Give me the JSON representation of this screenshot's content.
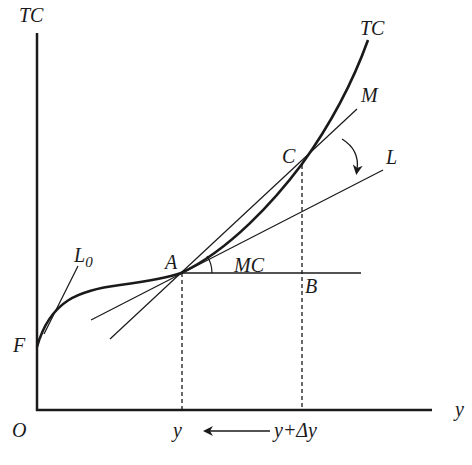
{
  "diagram": {
    "axes": {
      "y_axis_label": "TC",
      "x_axis_label": "y",
      "origin_label": "O"
    },
    "curve": {
      "name": "TC",
      "label": "TC"
    },
    "points": {
      "F": "F",
      "A": "A",
      "B": "B",
      "C": "C"
    },
    "lines": {
      "L0": "L",
      "L0_sub": "0",
      "M": "M",
      "L": "L"
    },
    "angle_label": "MC",
    "x_ticks": {
      "y": "y",
      "y_plus_dy": "y+Δy"
    },
    "colors": {
      "ink": "#1a1a1a",
      "background": "#ffffff"
    }
  }
}
